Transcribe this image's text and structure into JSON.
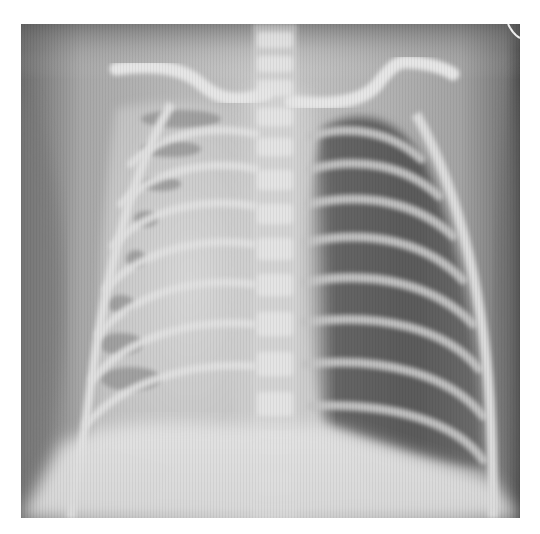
{
  "image": {
    "subject": "chest radiograph (frontal view)",
    "description": "Pediatric AP chest X-ray showing opacified right hemithorax (image left) with well-aerated left lung (image right), visible clavicles, ribs, spine and diaphragm",
    "palette": {
      "background": "#ffffff",
      "dark_air": "#5e5e5e",
      "soft_tissue": "#9c9c9c",
      "bone": "#e6e6e6",
      "opaque_lung": "#d4d4d4"
    }
  },
  "caption": {
    "text": ""
  }
}
